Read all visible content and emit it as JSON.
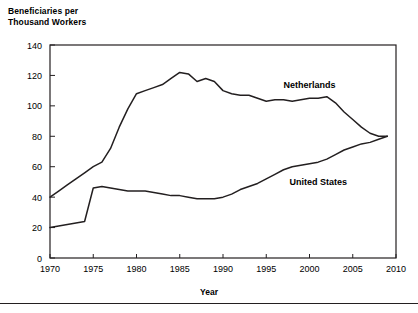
{
  "figure": {
    "y_axis_title": "Beneficiaries per\nThousand Workers",
    "x_axis_title": "Year"
  },
  "chart_data": {
    "type": "line",
    "title": "",
    "xlabel": "Year",
    "ylabel": "Beneficiaries per Thousand Workers",
    "xlim": [
      1970,
      2010
    ],
    "ylim": [
      0,
      140
    ],
    "xticks": [
      1970,
      1975,
      1980,
      1985,
      1990,
      1995,
      2000,
      2005,
      2010
    ],
    "yticks": [
      0,
      20,
      40,
      60,
      80,
      100,
      120,
      140
    ],
    "grid": false,
    "legend": "inline-annotations",
    "x": [
      1970,
      1971,
      1972,
      1973,
      1974,
      1975,
      1976,
      1977,
      1978,
      1979,
      1980,
      1981,
      1982,
      1983,
      1984,
      1985,
      1986,
      1987,
      1988,
      1989,
      1990,
      1991,
      1992,
      1993,
      1994,
      1995,
      1996,
      1997,
      1998,
      1999,
      2000,
      2001,
      2002,
      2003,
      2004,
      2005,
      2006,
      2007,
      2008,
      2009
    ],
    "series": [
      {
        "name": "Netherlands",
        "label_x": 2000,
        "label_y": 112,
        "values": [
          40,
          44,
          48,
          52,
          56,
          60,
          63,
          72,
          86,
          98,
          108,
          110,
          112,
          114,
          118,
          122,
          121,
          116,
          118,
          116,
          110,
          108,
          107,
          107,
          105,
          103,
          104,
          104,
          103,
          104,
          105,
          105,
          106,
          102,
          96,
          91,
          86,
          82,
          80,
          80
        ]
      },
      {
        "name": "United States",
        "label_x": 2001,
        "label_y": 48,
        "values": [
          20,
          21,
          22,
          23,
          24,
          46,
          47,
          46,
          45,
          44,
          44,
          44,
          43,
          42,
          41,
          41,
          40,
          39,
          39,
          39,
          40,
          42,
          45,
          47,
          49,
          52,
          55,
          58,
          60,
          61,
          62,
          63,
          65,
          68,
          71,
          73,
          75,
          76,
          78,
          80
        ]
      }
    ]
  }
}
